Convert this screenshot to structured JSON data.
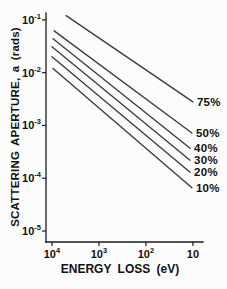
{
  "chart_data": {
    "type": "line",
    "title": "",
    "xlabel": "ENERGY LOSS (eV)",
    "ylabel": "SCATTERING APERTURE, a (rads)",
    "x_scale": "log",
    "y_scale": "log",
    "x_reversed": true,
    "grid": false,
    "legend_position": "right-of-line-ends",
    "x_range": [
      13400,
      6.1
    ],
    "y_range": [
      0.135,
      6.2e-06
    ],
    "x_ticks": [
      {
        "value": 10000,
        "base": "10",
        "exp": "4"
      },
      {
        "value": 1000,
        "base": "10",
        "exp": "3"
      },
      {
        "value": 100,
        "base": "10",
        "exp": "2"
      },
      {
        "value": 10,
        "base": "10",
        "exp": ""
      }
    ],
    "y_ticks": [
      {
        "value": 0.1,
        "base": "10",
        "exp": "-1"
      },
      {
        "value": 0.01,
        "base": "10",
        "exp": "-2"
      },
      {
        "value": 0.001,
        "base": "10",
        "exp": "-3"
      },
      {
        "value": 0.0001,
        "base": "10",
        "exp": "-4"
      },
      {
        "value": 1e-05,
        "base": "10",
        "exp": "-5"
      }
    ],
    "series": [
      {
        "name": "75%",
        "x": [
          5000,
          10
        ],
        "y": [
          0.12,
          0.0028
        ]
      },
      {
        "name": "50%",
        "x": [
          9000,
          10.5
        ],
        "y": [
          0.062,
          0.00072
        ]
      },
      {
        "name": "40%",
        "x": [
          9500,
          11.5
        ],
        "y": [
          0.044,
          0.00037
        ]
      },
      {
        "name": "30%",
        "x": [
          10000,
          11.5
        ],
        "y": [
          0.031,
          0.00022
        ]
      },
      {
        "name": "20%",
        "x": [
          10000,
          11.5
        ],
        "y": [
          0.02,
          0.00013
        ]
      },
      {
        "name": "10%",
        "x": [
          9500,
          10.5
        ],
        "y": [
          0.012,
          6.6e-05
        ]
      }
    ],
    "line_color": "#3d3d3d",
    "axis_color": "#1c1c1c",
    "text_color": "#111111",
    "background_color": "#fcfcfc"
  }
}
